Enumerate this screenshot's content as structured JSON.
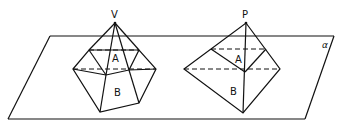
{
  "diagram": {
    "plane_label": "α",
    "left_figure": {
      "apex_label": "V",
      "region_labels": [
        "A",
        "B"
      ]
    },
    "right_figure": {
      "apex_label": "P",
      "region_labels": [
        "A",
        "B"
      ]
    }
  }
}
